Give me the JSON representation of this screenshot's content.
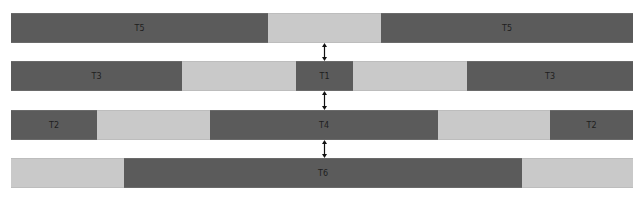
{
  "colors": {
    "busy": "#5b5b5b",
    "idle": "#c9c9c9",
    "label": "#1e1e1e",
    "arrow": "#111111"
  },
  "rows": [
    {
      "top": 13,
      "segments": [
        {
          "x0": 11,
          "x1": 268,
          "kind": "dark",
          "label": "T5"
        },
        {
          "x0": 268,
          "x1": 381,
          "kind": "light",
          "label": ""
        },
        {
          "x0": 381,
          "x1": 633,
          "kind": "dark",
          "label": "T5"
        }
      ]
    },
    {
      "top": 61,
      "segments": [
        {
          "x0": 11,
          "x1": 182,
          "kind": "dark",
          "label": "T3"
        },
        {
          "x0": 182,
          "x1": 296,
          "kind": "light",
          "label": ""
        },
        {
          "x0": 296,
          "x1": 353,
          "kind": "dark",
          "label": "T1"
        },
        {
          "x0": 353,
          "x1": 467,
          "kind": "light",
          "label": ""
        },
        {
          "x0": 467,
          "x1": 633,
          "kind": "dark",
          "label": "T3"
        }
      ]
    },
    {
      "top": 110,
      "segments": [
        {
          "x0": 11,
          "x1": 97,
          "kind": "dark",
          "label": "T2"
        },
        {
          "x0": 97,
          "x1": 210,
          "kind": "light",
          "label": ""
        },
        {
          "x0": 210,
          "x1": 438,
          "kind": "dark",
          "label": "T4"
        },
        {
          "x0": 438,
          "x1": 550,
          "kind": "light",
          "label": ""
        },
        {
          "x0": 550,
          "x1": 633,
          "kind": "dark",
          "label": "T2"
        }
      ]
    },
    {
      "top": 158,
      "segments": [
        {
          "x0": 11,
          "x1": 124,
          "kind": "light",
          "label": ""
        },
        {
          "x0": 124,
          "x1": 522,
          "kind": "dark",
          "label": "T6"
        },
        {
          "x0": 522,
          "x1": 633,
          "kind": "light",
          "label": ""
        }
      ]
    }
  ],
  "arrows": [
    {
      "x": 324,
      "y0": 43,
      "y1": 61
    },
    {
      "x": 324,
      "y0": 91,
      "y1": 110
    },
    {
      "x": 324,
      "y0": 140,
      "y1": 158
    }
  ]
}
